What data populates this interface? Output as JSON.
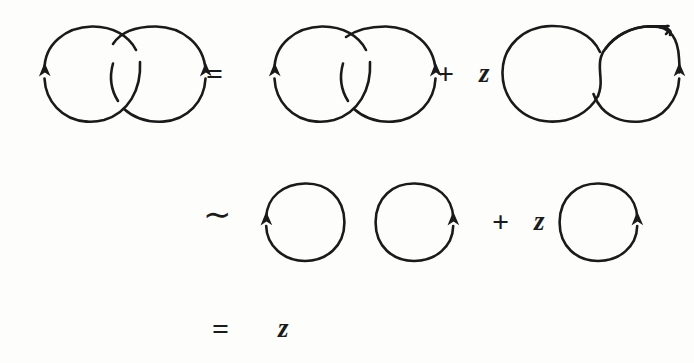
{
  "figure": {
    "kind": "knot-theory-skein-relation",
    "caption_text": "",
    "background_color": "#fdfdfc",
    "ink_color": "#1a1a1a",
    "stroke_width": 2.6
  },
  "rows": [
    {
      "id": "row-1",
      "terms": [
        {
          "type": "diagram",
          "name": "hopf-link-crossed",
          "label": ""
        },
        {
          "type": "operator",
          "name": "equals",
          "label": "="
        },
        {
          "type": "diagram",
          "name": "hopf-link-switched",
          "label": ""
        },
        {
          "type": "operator",
          "name": "plus",
          "label": "+"
        },
        {
          "type": "operator",
          "name": "variable-z",
          "label": "z"
        },
        {
          "type": "diagram",
          "name": "oriented-smoothing",
          "label": ""
        }
      ]
    },
    {
      "id": "row-2",
      "terms": [
        {
          "type": "operator",
          "name": "similar-to",
          "label": "∼"
        },
        {
          "type": "diagram",
          "name": "unknot-left",
          "label": ""
        },
        {
          "type": "diagram",
          "name": "unknot-right",
          "label": ""
        },
        {
          "type": "operator",
          "name": "plus",
          "label": "+"
        },
        {
          "type": "operator",
          "name": "variable-z",
          "label": "z"
        },
        {
          "type": "diagram",
          "name": "unknot-single",
          "label": ""
        }
      ]
    },
    {
      "id": "row-3",
      "terms": [
        {
          "type": "operator",
          "name": "equals",
          "label": "="
        },
        {
          "type": "operator",
          "name": "variable-z",
          "label": "z"
        }
      ]
    }
  ],
  "operators": {
    "equals": "=",
    "plus": "+",
    "tilde": "∼",
    "variable_z": "z"
  },
  "diagrams": {
    "hopf_link_crossed": {
      "name": "hopf-link-crossed",
      "description": "two interlinked circles with two crossings",
      "arrow_count": 2,
      "arrow_direction": "up"
    },
    "hopf_link_switched": {
      "name": "hopf-link-switched",
      "description": "two interlinked circles, crossing switched",
      "arrow_count": 2,
      "arrow_direction": "up"
    },
    "oriented_smoothing": {
      "name": "oriented-smoothing",
      "description": "oriented resolution, single curve with two lobes",
      "arrow_count": 1,
      "arrow_direction": "up"
    },
    "unknot_left": {
      "name": "unknot-left",
      "description": "single circle, arrow on left",
      "arrow_count": 1,
      "arrow_direction": "up"
    },
    "unknot_right": {
      "name": "unknot-right",
      "description": "single circle, arrow on right",
      "arrow_count": 1,
      "arrow_direction": "up"
    },
    "unknot_single": {
      "name": "unknot-single",
      "description": "single circle, arrow on right",
      "arrow_count": 1,
      "arrow_direction": "up"
    }
  }
}
